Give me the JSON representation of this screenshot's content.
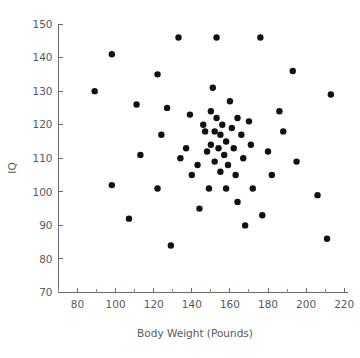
{
  "chart_data": {
    "type": "scatter",
    "title": "",
    "xlabel": "Body Weight (Pounds)",
    "ylabel": "IQ",
    "xlim": [
      70,
      222
    ],
    "ylim": [
      70,
      150
    ],
    "grid": false,
    "legend": null,
    "marker": {
      "shape": "circle",
      "color": "#111111",
      "size_px": 3.2
    },
    "xticks": [
      80,
      100,
      120,
      140,
      160,
      180,
      200,
      220
    ],
    "xtick_labels": [
      "80",
      "100",
      "120",
      "140",
      "160",
      "180",
      "200",
      "220"
    ],
    "xminor_step": 10,
    "yticks": [
      70,
      80,
      90,
      100,
      110,
      120,
      130,
      140,
      150
    ],
    "ytick_labels": [
      "70",
      "80",
      "90",
      "100",
      "110",
      "120",
      "130",
      "140",
      "150"
    ],
    "n_points": 60,
    "points": [
      {
        "x": 89,
        "y": 130
      },
      {
        "x": 98,
        "y": 141
      },
      {
        "x": 98,
        "y": 102
      },
      {
        "x": 107,
        "y": 92
      },
      {
        "x": 111,
        "y": 126
      },
      {
        "x": 113,
        "y": 111
      },
      {
        "x": 122,
        "y": 135
      },
      {
        "x": 122,
        "y": 101
      },
      {
        "x": 124,
        "y": 117
      },
      {
        "x": 127,
        "y": 125
      },
      {
        "x": 129,
        "y": 84
      },
      {
        "x": 133,
        "y": 146
      },
      {
        "x": 134,
        "y": 110
      },
      {
        "x": 137,
        "y": 113
      },
      {
        "x": 139,
        "y": 123
      },
      {
        "x": 140,
        "y": 105
      },
      {
        "x": 143,
        "y": 108
      },
      {
        "x": 144,
        "y": 95
      },
      {
        "x": 146,
        "y": 120
      },
      {
        "x": 147,
        "y": 118
      },
      {
        "x": 148,
        "y": 112
      },
      {
        "x": 149,
        "y": 101
      },
      {
        "x": 150,
        "y": 124
      },
      {
        "x": 150,
        "y": 114
      },
      {
        "x": 151,
        "y": 131
      },
      {
        "x": 152,
        "y": 118
      },
      {
        "x": 152,
        "y": 109
      },
      {
        "x": 153,
        "y": 146
      },
      {
        "x": 153,
        "y": 122
      },
      {
        "x": 154,
        "y": 113
      },
      {
        "x": 155,
        "y": 117
      },
      {
        "x": 155,
        "y": 106
      },
      {
        "x": 156,
        "y": 120
      },
      {
        "x": 157,
        "y": 111
      },
      {
        "x": 158,
        "y": 115
      },
      {
        "x": 158,
        "y": 101
      },
      {
        "x": 159,
        "y": 108
      },
      {
        "x": 160,
        "y": 127
      },
      {
        "x": 161,
        "y": 119
      },
      {
        "x": 162,
        "y": 113
      },
      {
        "x": 163,
        "y": 105
      },
      {
        "x": 164,
        "y": 122
      },
      {
        "x": 164,
        "y": 97
      },
      {
        "x": 166,
        "y": 117
      },
      {
        "x": 167,
        "y": 110
      },
      {
        "x": 168,
        "y": 90
      },
      {
        "x": 170,
        "y": 121
      },
      {
        "x": 171,
        "y": 114
      },
      {
        "x": 172,
        "y": 101
      },
      {
        "x": 176,
        "y": 146
      },
      {
        "x": 177,
        "y": 93
      },
      {
        "x": 180,
        "y": 112
      },
      {
        "x": 182,
        "y": 105
      },
      {
        "x": 186,
        "y": 124
      },
      {
        "x": 188,
        "y": 118
      },
      {
        "x": 193,
        "y": 136
      },
      {
        "x": 195,
        "y": 109
      },
      {
        "x": 206,
        "y": 99
      },
      {
        "x": 211,
        "y": 86
      },
      {
        "x": 213,
        "y": 129
      }
    ]
  },
  "axes": {
    "x_axis_name": "Body Weight (Pounds)",
    "y_axis_name": "IQ"
  }
}
